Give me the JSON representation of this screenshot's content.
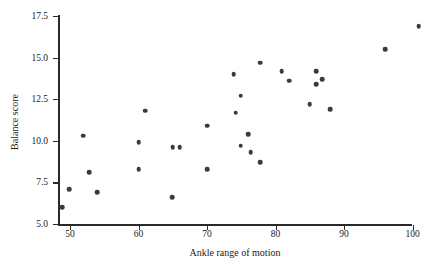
{
  "chart_data": {
    "type": "scatter",
    "title": "",
    "xlabel": "Ankle range of motion",
    "ylabel": "Balance score",
    "xlim": [
      46,
      104
    ],
    "ylim": [
      4.7,
      17.9
    ],
    "xticks": [
      50,
      60,
      70,
      80,
      90,
      100
    ],
    "yticks": [
      "5.0",
      "7.5",
      "10.0",
      "12.5",
      "15.0",
      "17.5"
    ],
    "ytick_values": [
      5.0,
      7.5,
      10.0,
      12.5,
      15.0,
      17.5
    ],
    "grid": false,
    "legend": null,
    "marker": "filled-circle",
    "marker_color": "#3b3b3b",
    "points": [
      {
        "x": 48.9,
        "y": 6.0
      },
      {
        "x": 49.9,
        "y": 7.1
      },
      {
        "x": 51.9,
        "y": 10.3
      },
      {
        "x": 52.8,
        "y": 8.1
      },
      {
        "x": 54.0,
        "y": 6.9
      },
      {
        "x": 60.0,
        "y": 9.9
      },
      {
        "x": 60.0,
        "y": 8.3
      },
      {
        "x": 61.0,
        "y": 11.8
      },
      {
        "x": 64.9,
        "y": 6.6
      },
      {
        "x": 65.0,
        "y": 9.6
      },
      {
        "x": 66.0,
        "y": 9.6
      },
      {
        "x": 70.0,
        "y": 10.9
      },
      {
        "x": 70.0,
        "y": 8.3
      },
      {
        "x": 73.9,
        "y": 14.0
      },
      {
        "x": 74.2,
        "y": 11.7
      },
      {
        "x": 74.9,
        "y": 12.7
      },
      {
        "x": 74.9,
        "y": 9.7
      },
      {
        "x": 76.0,
        "y": 10.4
      },
      {
        "x": 76.4,
        "y": 9.3
      },
      {
        "x": 77.8,
        "y": 14.7
      },
      {
        "x": 77.8,
        "y": 8.7
      },
      {
        "x": 80.9,
        "y": 14.2
      },
      {
        "x": 82.0,
        "y": 13.6
      },
      {
        "x": 85.0,
        "y": 12.2
      },
      {
        "x": 85.9,
        "y": 14.2
      },
      {
        "x": 85.9,
        "y": 13.4
      },
      {
        "x": 86.8,
        "y": 13.7
      },
      {
        "x": 88.0,
        "y": 11.9
      },
      {
        "x": 96.0,
        "y": 15.5
      },
      {
        "x": 100.9,
        "y": 16.9
      }
    ]
  }
}
